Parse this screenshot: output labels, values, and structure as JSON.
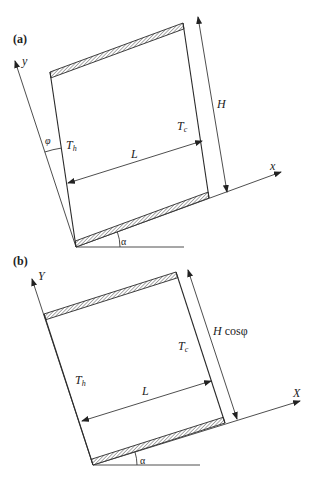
{
  "figure": {
    "panels": [
      {
        "label": "(a)",
        "axis_x": "x",
        "axis_y": "y",
        "hot_wall": {
          "symbol": "T",
          "subscript": "h"
        },
        "cold_wall": {
          "symbol": "T",
          "subscript": "c"
        },
        "width_label": "L",
        "height_label": {
          "main": "H",
          "suffix": ""
        },
        "tilt_angle": "α",
        "skew_angle": "φ"
      },
      {
        "label": "(b)",
        "axis_x": "X",
        "axis_y": "Y",
        "hot_wall": {
          "symbol": "T",
          "subscript": "h"
        },
        "cold_wall": {
          "symbol": "T",
          "subscript": "c"
        },
        "width_label": "L",
        "height_label": {
          "main": "H",
          "suffix": " cosφ"
        },
        "tilt_angle": "α"
      }
    ]
  }
}
